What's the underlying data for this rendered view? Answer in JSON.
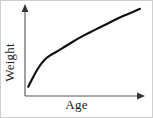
{
  "figure": {
    "background_color": "#ffffff",
    "frame_color": "#cfcfcf",
    "width": 153,
    "height": 118
  },
  "axes": {
    "x": {
      "label": "Age",
      "arrow": "arrow-right",
      "color": "#555555"
    },
    "y": {
      "label": "Weight",
      "arrow": "arrow-up",
      "color": "#555555"
    }
  },
  "chart_data": {
    "type": "line",
    "title": "",
    "xlabel": "Age",
    "ylabel": "Weight",
    "grid": false,
    "legend": null,
    "xlim": [
      0,
      100
    ],
    "ylim": [
      0,
      100
    ],
    "xticks": [],
    "yticks": [],
    "annotations": [],
    "series": [
      {
        "name": "growth-curve",
        "color": "#111111",
        "line_width": 2.2,
        "description": "Monotonically increasing curve: steep rise at low Age, a bend, then a gentler near-linear rise to the top right.",
        "x": [
          2,
          6,
          10,
          14,
          18,
          22,
          26,
          32,
          40,
          50,
          60,
          70,
          80,
          90,
          100
        ],
        "y": [
          4,
          15,
          25,
          33,
          39,
          43,
          46,
          51,
          58,
          66,
          73,
          80,
          87,
          93,
          99
        ]
      }
    ]
  }
}
